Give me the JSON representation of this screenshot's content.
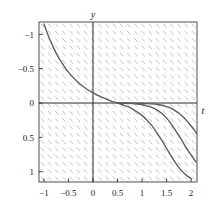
{
  "figure": {
    "kind": "slope-field-with-solution-curves",
    "background_color": "#ffffff",
    "frame_color": "#3a3a3a",
    "axis_color": "#2a2a2a",
    "slope_field_color": "#b6b6bd",
    "curve_color": "#5a5a5f"
  },
  "axes": {
    "x_title": "t",
    "y_title": "y",
    "x_ticks": [
      "-1",
      "-0.5",
      "0",
      "0.5",
      "1",
      "1.5",
      "2"
    ],
    "y_ticks": [
      "1",
      "0.5",
      "0",
      "-0.5",
      "-1"
    ]
  },
  "chart_data": {
    "type": "line",
    "title": "",
    "xlabel": "t",
    "ylabel": "y",
    "xlim": [
      -1.1,
      2.12
    ],
    "ylim": [
      -1.15,
      1.18
    ],
    "grid": false,
    "legend": "none",
    "x": [
      "-1",
      "-0.5",
      "0",
      "0.5",
      "1",
      "1.5",
      "2"
    ],
    "xtick_values": [
      -1,
      -0.5,
      0,
      0.5,
      1,
      1.5,
      2
    ],
    "ytick_values": [
      -1,
      -0.5,
      0,
      0.5,
      1
    ],
    "slope_field": {
      "description": "short line segments of negative slope on a regular grid",
      "segment_slope": -1.15,
      "segment_length_px": 5,
      "columns": 21,
      "rows": 21
    },
    "series": [
      {
        "name": "solution-curve-1",
        "points": [
          [
            -1.0,
            1.15
          ],
          [
            -0.9,
            0.96
          ],
          [
            -0.8,
            0.8
          ],
          [
            -0.7,
            0.66
          ],
          [
            -0.6,
            0.55
          ],
          [
            -0.5,
            0.45
          ],
          [
            -0.4,
            0.37
          ],
          [
            -0.3,
            0.3
          ],
          [
            -0.2,
            0.24
          ],
          [
            -0.1,
            0.19
          ],
          [
            0.0,
            0.15
          ],
          [
            0.1,
            0.11
          ],
          [
            0.2,
            0.08
          ],
          [
            0.3,
            0.05
          ],
          [
            0.4,
            0.02
          ],
          [
            0.5,
            0.0
          ],
          [
            0.6,
            -0.025
          ],
          [
            0.7,
            -0.05
          ],
          [
            0.8,
            -0.085
          ],
          [
            0.9,
            -0.13
          ],
          [
            1.0,
            -0.18
          ],
          [
            1.1,
            -0.25
          ],
          [
            1.2,
            -0.33
          ],
          [
            1.3,
            -0.43
          ],
          [
            1.4,
            -0.54
          ],
          [
            1.5,
            -0.66
          ],
          [
            1.6,
            -0.78
          ],
          [
            1.7,
            -0.89
          ],
          [
            1.8,
            -0.98
          ],
          [
            1.9,
            -1.05
          ],
          [
            2.0,
            -1.1
          ]
        ]
      },
      {
        "name": "solution-curve-2",
        "points": [
          [
            0.5,
            0.0
          ],
          [
            0.7,
            -0.005
          ],
          [
            0.9,
            -0.015
          ],
          [
            1.0,
            -0.025
          ],
          [
            1.1,
            -0.04
          ],
          [
            1.2,
            -0.065
          ],
          [
            1.3,
            -0.1
          ],
          [
            1.4,
            -0.15
          ],
          [
            1.5,
            -0.22
          ],
          [
            1.6,
            -0.31
          ],
          [
            1.7,
            -0.42
          ],
          [
            1.8,
            -0.53
          ],
          [
            1.9,
            -0.65
          ],
          [
            2.0,
            -0.76
          ],
          [
            2.1,
            -0.86
          ]
        ]
      },
      {
        "name": "solution-curve-3",
        "points": [
          [
            0.5,
            0.0
          ],
          [
            1.0,
            -0.005
          ],
          [
            1.2,
            -0.012
          ],
          [
            1.35,
            -0.025
          ],
          [
            1.45,
            -0.04
          ],
          [
            1.55,
            -0.065
          ],
          [
            1.65,
            -0.1
          ],
          [
            1.75,
            -0.15
          ],
          [
            1.85,
            -0.21
          ],
          [
            1.95,
            -0.29
          ],
          [
            2.05,
            -0.38
          ],
          [
            2.12,
            -0.45
          ]
        ]
      }
    ]
  }
}
